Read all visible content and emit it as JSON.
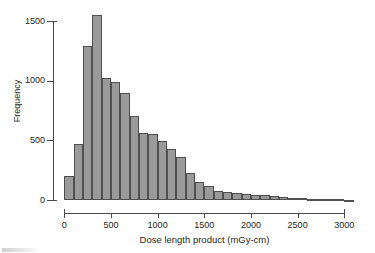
{
  "chart_data": {
    "type": "bar",
    "title": "",
    "subtitle": "",
    "xlabel": "Dose length product (mGy-cm)",
    "ylabel": "Frequency",
    "xlim": [
      0,
      3100
    ],
    "ylim": [
      0,
      1600
    ],
    "xticks": [
      0,
      500,
      1000,
      1500,
      2000,
      2500,
      3000
    ],
    "xtick_labels": [
      "0",
      "500",
      "1000",
      "1500",
      "2000",
      "2500",
      "3000"
    ],
    "yticks": [
      0,
      500,
      1000,
      1500
    ],
    "ytick_labels": [
      "0",
      "500",
      "1000",
      "1500"
    ],
    "grid": false,
    "legend": null,
    "bin_width": 100,
    "bar_color": "#9a9a9a",
    "bar_edge_color": "#4f4f4f",
    "axis_color": "#4a4a4a",
    "bins": [
      {
        "x0": 0,
        "x1": 100,
        "value": 200
      },
      {
        "x0": 100,
        "x1": 200,
        "value": 470
      },
      {
        "x0": 200,
        "x1": 300,
        "value": 1290
      },
      {
        "x0": 300,
        "x1": 400,
        "value": 1550
      },
      {
        "x0": 400,
        "x1": 500,
        "value": 1025
      },
      {
        "x0": 500,
        "x1": 600,
        "value": 990
      },
      {
        "x0": 600,
        "x1": 700,
        "value": 895
      },
      {
        "x0": 700,
        "x1": 800,
        "value": 705
      },
      {
        "x0": 800,
        "x1": 900,
        "value": 565
      },
      {
        "x0": 900,
        "x1": 1000,
        "value": 555
      },
      {
        "x0": 1000,
        "x1": 1100,
        "value": 495
      },
      {
        "x0": 1100,
        "x1": 1200,
        "value": 425
      },
      {
        "x0": 1200,
        "x1": 1300,
        "value": 360
      },
      {
        "x0": 1300,
        "x1": 1400,
        "value": 230
      },
      {
        "x0": 1400,
        "x1": 1500,
        "value": 150
      },
      {
        "x0": 1500,
        "x1": 1600,
        "value": 120
      },
      {
        "x0": 1600,
        "x1": 1700,
        "value": 75
      },
      {
        "x0": 1700,
        "x1": 1800,
        "value": 68
      },
      {
        "x0": 1800,
        "x1": 1900,
        "value": 55
      },
      {
        "x0": 1900,
        "x1": 2000,
        "value": 52
      },
      {
        "x0": 2000,
        "x1": 2100,
        "value": 45
      },
      {
        "x0": 2100,
        "x1": 2200,
        "value": 40
      },
      {
        "x0": 2200,
        "x1": 2300,
        "value": 35
      },
      {
        "x0": 2300,
        "x1": 2400,
        "value": 22
      },
      {
        "x0": 2400,
        "x1": 2500,
        "value": 20
      },
      {
        "x0": 2500,
        "x1": 2600,
        "value": 18
      },
      {
        "x0": 2600,
        "x1": 2700,
        "value": 12
      },
      {
        "x0": 2700,
        "x1": 2800,
        "value": 10
      },
      {
        "x0": 2800,
        "x1": 2900,
        "value": 8
      },
      {
        "x0": 2900,
        "x1": 3000,
        "value": 6
      },
      {
        "x0": 3000,
        "x1": 3100,
        "value": 4
      }
    ]
  }
}
